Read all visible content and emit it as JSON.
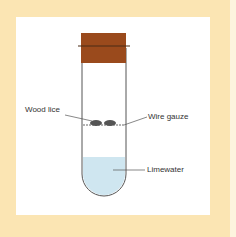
{
  "diagram": {
    "type": "experiment-apparatus",
    "labels": {
      "wood_lice": "Wood lice",
      "wire_gauze": "Wire gauze",
      "limewater": "Limewater"
    },
    "colors": {
      "background": "#fbe5b3",
      "panel": "#ffffff",
      "cork": "#9a4a1c",
      "limewater": "#cfe6f0",
      "outline": "#444444"
    }
  }
}
